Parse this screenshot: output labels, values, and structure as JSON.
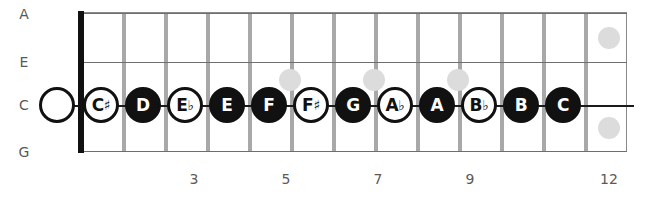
{
  "diagram": {
    "instrument": "ukulele",
    "geometry": {
      "board_left": 78,
      "board_right": 627,
      "board_top": 12,
      "board_bottom": 152,
      "fret_spacing": 42,
      "first_note_x": 101,
      "note_row_y": 105,
      "open_string_x": 57
    },
    "strings": [
      {
        "name": "A",
        "y": 14
      },
      {
        "name": "E",
        "y": 62
      },
      {
        "name": "C",
        "y": 105
      },
      {
        "name": "G",
        "y": 152
      }
    ],
    "string_lines": [
      {
        "name": "A-string-line",
        "y": 13,
        "primary": false
      },
      {
        "name": "E-string-line",
        "y": 62,
        "primary": false
      },
      {
        "name": "C-string-line",
        "y": 105,
        "primary": true
      },
      {
        "name": "G-string-line",
        "y": 151,
        "primary": false
      }
    ],
    "open_string": {
      "label": "",
      "name": "open-string-marker"
    },
    "fret_wires": [
      {
        "fret": 1,
        "x": 122
      },
      {
        "fret": 2,
        "x": 164
      },
      {
        "fret": 3,
        "x": 206
      },
      {
        "fret": 4,
        "x": 248
      },
      {
        "fret": 5,
        "x": 290
      },
      {
        "fret": 6,
        "x": 332
      },
      {
        "fret": 7,
        "x": 374
      },
      {
        "fret": 8,
        "x": 416
      },
      {
        "fret": 9,
        "x": 458
      },
      {
        "fret": 10,
        "x": 500
      },
      {
        "fret": 11,
        "x": 542
      },
      {
        "fret": 12,
        "x": 584
      }
    ],
    "inlays": [
      {
        "fret": 5,
        "x": 290,
        "y": 80
      },
      {
        "fret": 7,
        "x": 374,
        "y": 80
      },
      {
        "fret": 9,
        "x": 458,
        "y": 80
      },
      {
        "fret": 12,
        "x": 609,
        "y": 38
      },
      {
        "fret": 12,
        "x": 609,
        "y": 128
      }
    ],
    "fret_numbers": [
      {
        "label": "3",
        "x": 194
      },
      {
        "label": "5",
        "x": 286
      },
      {
        "label": "7",
        "x": 378
      },
      {
        "label": "9",
        "x": 470
      },
      {
        "label": "12",
        "x": 609
      }
    ],
    "notes": [
      {
        "label": "C",
        "accidental": "♯",
        "fret": 1,
        "x": 101,
        "style": "open"
      },
      {
        "label": "D",
        "accidental": "",
        "fret": 2,
        "x": 143,
        "style": "filled"
      },
      {
        "label": "E",
        "accidental": "♭",
        "fret": 3,
        "x": 185,
        "style": "open"
      },
      {
        "label": "E",
        "accidental": "",
        "fret": 4,
        "x": 227,
        "style": "filled"
      },
      {
        "label": "F",
        "accidental": "",
        "fret": 5,
        "x": 269,
        "style": "filled"
      },
      {
        "label": "F",
        "accidental": "♯",
        "fret": 6,
        "x": 311,
        "style": "open"
      },
      {
        "label": "G",
        "accidental": "",
        "fret": 7,
        "x": 353,
        "style": "filled"
      },
      {
        "label": "A",
        "accidental": "♭",
        "fret": 8,
        "x": 395,
        "style": "open"
      },
      {
        "label": "A",
        "accidental": "",
        "fret": 9,
        "x": 437,
        "style": "filled"
      },
      {
        "label": "B",
        "accidental": "♭",
        "fret": 10,
        "x": 479,
        "style": "open"
      },
      {
        "label": "B",
        "accidental": "",
        "fret": 11,
        "x": 521,
        "style": "filled"
      },
      {
        "label": "C",
        "accidental": "",
        "fret": 12,
        "x": 563,
        "style": "filled"
      }
    ],
    "colors": {
      "note_fill": "#111111",
      "note_outline": "#111111",
      "fret_wire": "#a8a8a8",
      "inlay": "#dcdcdc",
      "board_border": "#8a8a8a",
      "label_text": "#595959",
      "nut": "#111111"
    }
  }
}
